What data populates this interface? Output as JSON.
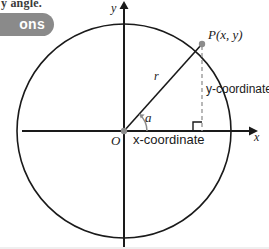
{
  "page": {
    "width": 269,
    "height": 249,
    "background_color": "#ffffff"
  },
  "header": {
    "cutoff_heading": "y angle.",
    "pill": {
      "label": "ons",
      "background_color": "#8a8a8a",
      "text_color": "#ffffff"
    }
  },
  "diagram": {
    "type": "geometry-diagram",
    "stroke_color": "#1a1a1a",
    "dashed_color": "#9a9a9a",
    "dot_color": "#8c8c8c",
    "labels": {
      "y_axis": "y",
      "x_axis": "x",
      "origin": "O",
      "point_p": "P(x, y)",
      "radius": "r",
      "angle": "a",
      "x_coordinate": "x-coordinate",
      "y_coordinate": "y-coordinate"
    },
    "geometry": {
      "origin": {
        "x": 124,
        "y": 131
      },
      "circle_radius": 107,
      "point_p": {
        "x": 202,
        "y": 44
      },
      "foot_of_perpendicular": {
        "x": 202,
        "y": 131
      },
      "x_axis": {
        "x1": 22,
        "y1": 131,
        "x2": 252,
        "y2": 131
      },
      "y_axis": {
        "x1": 124,
        "y1": 247,
        "x2": 124,
        "y2": 6
      },
      "angle_arc_radius": 22,
      "right_angle_marker_size": 9
    }
  }
}
